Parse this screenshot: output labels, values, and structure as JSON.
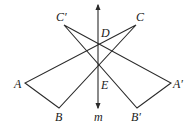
{
  "diagram": {
    "type": "geometry-reflection",
    "axis": {
      "name": "m",
      "label": "m",
      "x": 98,
      "y_top": 6,
      "y_bottom": 107
    },
    "points": {
      "A": {
        "label": "A",
        "x": 25,
        "y": 83
      },
      "B": {
        "label": "B",
        "x": 59,
        "y": 108
      },
      "C": {
        "label": "C",
        "x": 136,
        "y": 25
      },
      "A_prime": {
        "label": "A′",
        "x": 171,
        "y": 83
      },
      "B_prime": {
        "label": "B′",
        "x": 137,
        "y": 108
      },
      "C_prime": {
        "label": "C′",
        "x": 64,
        "y": 25
      },
      "D": {
        "label": "D",
        "x": 98,
        "y": 43
      },
      "E": {
        "label": "E",
        "x": 98,
        "y": 62
      }
    },
    "triangles": [
      {
        "name": "ABC",
        "vertices": [
          "A",
          "B",
          "C"
        ]
      },
      {
        "name": "A′B′C′",
        "vertices": [
          "A′",
          "B′",
          "C′"
        ]
      }
    ],
    "colors": {
      "stroke": "#2a2a2a",
      "text": "#1a1a1a",
      "background": "#ffffff"
    }
  }
}
